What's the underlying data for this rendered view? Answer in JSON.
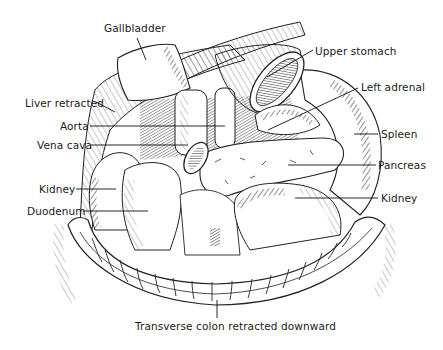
{
  "diagram": {
    "type": "anatomical-illustration",
    "labels": [
      {
        "id": "gallbladder",
        "text": "Gallbladder",
        "x": 104,
        "y": 28
      },
      {
        "id": "upper-stomach",
        "text": "Upper stomach",
        "x": 315,
        "y": 45
      },
      {
        "id": "left-adrenal",
        "text": "Left adrenal",
        "x": 361,
        "y": 81
      },
      {
        "id": "liver-retracted",
        "text": "Liver retracted",
        "x": 25,
        "y": 97
      },
      {
        "id": "aorta",
        "text": "Aorta",
        "x": 60,
        "y": 121
      },
      {
        "id": "spleen",
        "text": "Spleen",
        "x": 381,
        "y": 129
      },
      {
        "id": "vena-cava",
        "text": "Vena cava",
        "x": 37,
        "y": 140
      },
      {
        "id": "pancreas",
        "text": "Pancreas",
        "x": 378,
        "y": 159
      },
      {
        "id": "kidney-left-side",
        "text": "Kidney",
        "x": 39,
        "y": 183
      },
      {
        "id": "kidney-right-side",
        "text": "Kidney",
        "x": 381,
        "y": 193
      },
      {
        "id": "duodenum",
        "text": "Duodenum",
        "x": 27,
        "y": 205
      },
      {
        "id": "transverse-colon",
        "text": "Transverse colon retracted downward",
        "x": 135,
        "y": 322
      }
    ]
  }
}
